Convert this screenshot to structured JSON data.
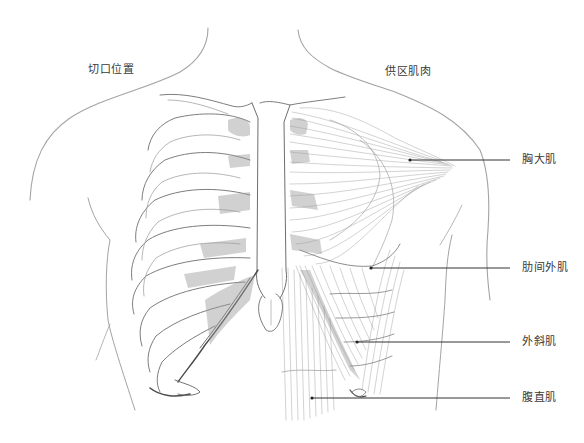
{
  "figure": {
    "left_heading": "切口位置",
    "right_heading": "供区肌肉"
  },
  "labels": [
    {
      "id": "pectoralis-major",
      "text": "胸大肌",
      "anchor": [
        410,
        160
      ],
      "line_end": [
        510,
        160
      ],
      "text_pos": [
        522,
        154
      ]
    },
    {
      "id": "external-intercostal",
      "text": "肋间外肌",
      "anchor": [
        371,
        268
      ],
      "line_end": [
        510,
        268
      ],
      "text_pos": [
        522,
        262
      ]
    },
    {
      "id": "external-oblique",
      "text": "外斜肌",
      "anchor": [
        357,
        342
      ],
      "line_end": [
        510,
        342
      ],
      "text_pos": [
        522,
        336
      ]
    },
    {
      "id": "rectus-abdominis",
      "text": "腹直肌",
      "anchor": [
        312,
        398
      ],
      "line_end": [
        510,
        398
      ],
      "text_pos": [
        522,
        392
      ]
    }
  ],
  "colors": {
    "background": "#ffffff",
    "pencil_stroke": "#6e6e6e",
    "leader_line": "#333333",
    "label_text": "#3a3a3a"
  }
}
